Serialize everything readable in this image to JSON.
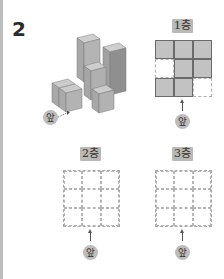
{
  "problem": {
    "number": "2"
  },
  "iso_view": {
    "front_label": "앞",
    "description": "isometric stack of unit cubes"
  },
  "floors": [
    {
      "label": "1층",
      "cells": [
        [
          "filled",
          "filled",
          "filled"
        ],
        [
          "empty",
          "filled",
          "filled"
        ],
        [
          "filled",
          "filled",
          "empty"
        ]
      ],
      "front_label": "앞"
    },
    {
      "label": "2층",
      "cells": [
        [
          "empty",
          "empty",
          "empty"
        ],
        [
          "empty",
          "empty",
          "empty"
        ],
        [
          "empty",
          "empty",
          "empty"
        ]
      ],
      "front_label": "앞"
    },
    {
      "label": "3층",
      "cells": [
        [
          "empty",
          "empty",
          "empty"
        ],
        [
          "empty",
          "empty",
          "empty"
        ],
        [
          "empty",
          "empty",
          "empty"
        ]
      ],
      "front_label": "앞"
    }
  ],
  "colors": {
    "cube_top": "#c9c9c9",
    "cube_left": "#a9a9a9",
    "cube_right": "#8f8f8f",
    "label_bg": "#b9b9b9",
    "filled_cell": "#c2c2c2"
  }
}
